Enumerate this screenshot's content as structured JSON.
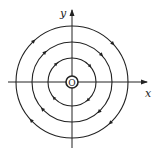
{
  "diagram": {
    "type": "phase-portrait",
    "center": {
      "x": 72,
      "y": 82
    },
    "axes": {
      "x_label": "x",
      "y_label": "y",
      "origin_label": "O"
    },
    "orbits": [
      {
        "radius": 6
      },
      {
        "radius": 24
      },
      {
        "radius": 40
      },
      {
        "radius": 56
      }
    ],
    "flow_direction": "clockwise",
    "colors": {
      "stroke": "#222222",
      "background": "#ffffff"
    }
  }
}
